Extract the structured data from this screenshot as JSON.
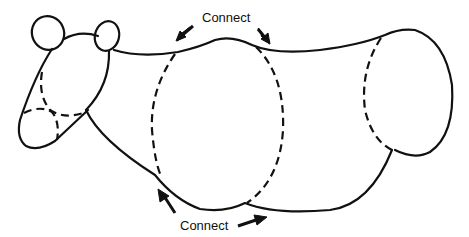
{
  "diagram": {
    "labels": {
      "top_connect": "Connect",
      "bottom_connect": "Connect"
    },
    "parts": [
      {
        "name": "left-ear",
        "style": "solid"
      },
      {
        "name": "right-ear",
        "style": "solid"
      },
      {
        "name": "head",
        "style": "solid"
      },
      {
        "name": "snout",
        "style": "dashed-overlap"
      },
      {
        "name": "front-body-segment",
        "style": "dashed"
      },
      {
        "name": "rear-body-segment",
        "style": "dashed"
      },
      {
        "name": "body-outline",
        "style": "solid"
      }
    ],
    "arrows": [
      {
        "label_ref": "top_connect",
        "direction": "down-left"
      },
      {
        "label_ref": "top_connect",
        "direction": "down-right"
      },
      {
        "label_ref": "bottom_connect",
        "direction": "up-left"
      },
      {
        "label_ref": "bottom_connect",
        "direction": "right"
      }
    ],
    "colors": {
      "stroke": "#111111",
      "background": "#ffffff"
    }
  }
}
